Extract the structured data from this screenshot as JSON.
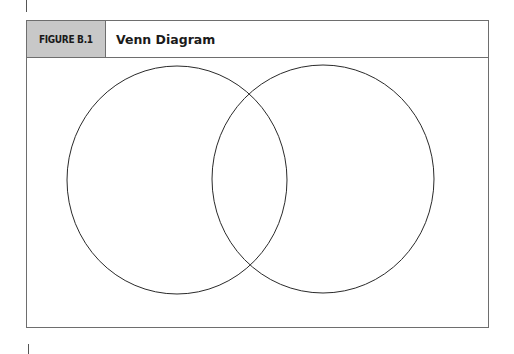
{
  "figure": {
    "label": "FIGURE B.1",
    "title": "Venn Diagram"
  },
  "diagram": {
    "type": "venn",
    "sets": 2,
    "circles": [
      {
        "name": "left-set",
        "cx": 177,
        "cy": 180,
        "rx": 110,
        "ry": 114
      },
      {
        "name": "right-set",
        "cx": 323,
        "cy": 179,
        "rx": 111,
        "ry": 114
      }
    ],
    "stroke_color": "#2a2a2a"
  },
  "colors": {
    "label_bg": "#c8c8c8",
    "border": "#6e6e6e"
  }
}
